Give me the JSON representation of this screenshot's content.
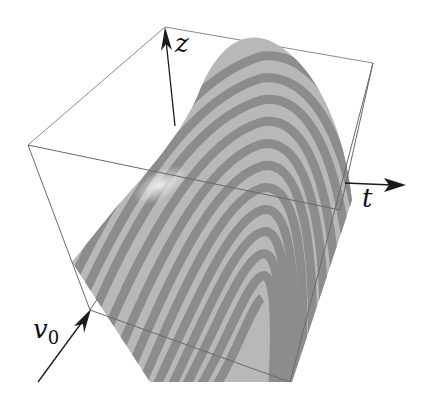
{
  "figure": {
    "type": "3d-surface-plot",
    "axes": {
      "z": {
        "label": "z"
      },
      "t": {
        "label": "t"
      },
      "v0": {
        "label": "v",
        "subscript": "0"
      }
    },
    "colors": {
      "background": "#ffffff",
      "box_edge": "#7a7a7a",
      "axis_arrow": "#1a1a1a",
      "stripe_light": "#b8b8b8",
      "stripe_dark": "#8a8a8a",
      "highlight": "#e6e6e6"
    },
    "stripe_count": 22
  }
}
